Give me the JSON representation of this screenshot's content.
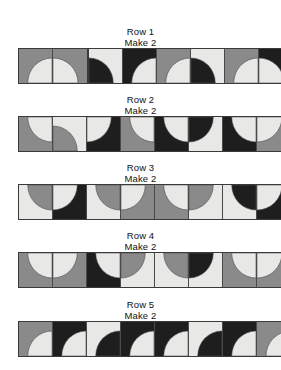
{
  "page": {
    "background_color": "#ffffff"
  },
  "palette": {
    "light": "#e8e8e6",
    "medium": "#8a8a8a",
    "dark": "#1e1e1e",
    "outline": "#3a3a3a",
    "seam": "#4a4a4a",
    "text": "#111111"
  },
  "labels": {
    "make": "Make 2"
  },
  "rows": [
    {
      "name": "Row 1",
      "make": "Make 2",
      "segments": [
        {
          "left": 18,
          "blocks": [
            {
              "bg": "medium",
              "arc": "light",
              "corner": "bottom-right"
            },
            {
              "bg": "medium",
              "arc": "light",
              "corner": "bottom-left"
            }
          ]
        },
        {
          "left": 88,
          "blocks": [
            {
              "bg": "light",
              "arc": "dark",
              "corner": "bottom-left"
            },
            {
              "bg": "dark",
              "arc": "light",
              "corner": "bottom-right"
            },
            {
              "bg": "medium",
              "arc": "light",
              "corner": "bottom-right"
            },
            {
              "bg": "light",
              "arc": "dark",
              "corner": "bottom-left"
            },
            {
              "bg": "medium",
              "arc": "light",
              "corner": "bottom-right"
            },
            {
              "bg": "dark",
              "arc": "light",
              "corner": "bottom-left"
            }
          ]
        }
      ]
    },
    {
      "name": "Row 2",
      "make": "Make 2",
      "segments": [
        {
          "left": 18,
          "blocks": [
            {
              "bg": "medium",
              "arc": "light",
              "corner": "top-right"
            },
            {
              "bg": "light",
              "arc": "medium",
              "corner": "bottom-left"
            },
            {
              "bg": "dark",
              "arc": "light",
              "corner": "top-left"
            },
            {
              "bg": "medium",
              "arc": "light",
              "corner": "top-right"
            },
            {
              "bg": "dark",
              "arc": "light",
              "corner": "top-right"
            },
            {
              "bg": "light",
              "arc": "dark",
              "corner": "top-left"
            },
            {
              "bg": "dark",
              "arc": "light",
              "corner": "top-right"
            },
            {
              "bg": "medium",
              "arc": "light",
              "corner": "top-left"
            }
          ]
        }
      ]
    },
    {
      "name": "Row 3",
      "make": "Make 2",
      "segments": [
        {
          "left": 18,
          "blocks": [
            {
              "bg": "light",
              "arc": "medium",
              "corner": "top-right"
            },
            {
              "bg": "dark",
              "arc": "light",
              "corner": "top-left"
            },
            {
              "bg": "light",
              "arc": "medium",
              "corner": "top-right"
            },
            {
              "bg": "medium",
              "arc": "light",
              "corner": "top-left"
            },
            {
              "bg": "medium",
              "arc": "light",
              "corner": "top-right"
            },
            {
              "bg": "light",
              "arc": "medium",
              "corner": "top-left"
            },
            {
              "bg": "light",
              "arc": "dark",
              "corner": "top-right"
            },
            {
              "bg": "dark",
              "arc": "light",
              "corner": "top-left"
            }
          ]
        }
      ]
    },
    {
      "name": "Row 4",
      "make": "Make 2",
      "segments": [
        {
          "left": 18,
          "blocks": [
            {
              "bg": "medium",
              "arc": "light",
              "corner": "top-right"
            },
            {
              "bg": "medium",
              "arc": "light",
              "corner": "top-left"
            },
            {
              "bg": "dark",
              "arc": "light",
              "corner": "top-right"
            },
            {
              "bg": "light",
              "arc": "medium",
              "corner": "top-left"
            },
            {
              "bg": "light",
              "arc": "medium",
              "corner": "top-right"
            },
            {
              "bg": "light",
              "arc": "dark",
              "corner": "top-left"
            },
            {
              "bg": "medium",
              "arc": "light",
              "corner": "top-right"
            },
            {
              "bg": "medium",
              "arc": "light",
              "corner": "top-left"
            }
          ]
        }
      ]
    },
    {
      "name": "Row 5",
      "make": "Make 2",
      "segments": [
        {
          "left": 18,
          "blocks": [
            {
              "bg": "medium",
              "arc": "light",
              "corner": "bottom-right"
            },
            {
              "bg": "dark",
              "arc": "light",
              "corner": "bottom-right"
            },
            {
              "bg": "light",
              "arc": "dark",
              "corner": "bottom-right"
            },
            {
              "bg": "dark",
              "arc": "light",
              "corner": "bottom-right"
            },
            {
              "bg": "dark",
              "arc": "light",
              "corner": "bottom-right"
            },
            {
              "bg": "light",
              "arc": "dark",
              "corner": "bottom-right"
            },
            {
              "bg": "dark",
              "arc": "light",
              "corner": "bottom-right"
            },
            {
              "bg": "medium",
              "arc": "light",
              "corner": "bottom-right"
            }
          ]
        }
      ]
    }
  ]
}
